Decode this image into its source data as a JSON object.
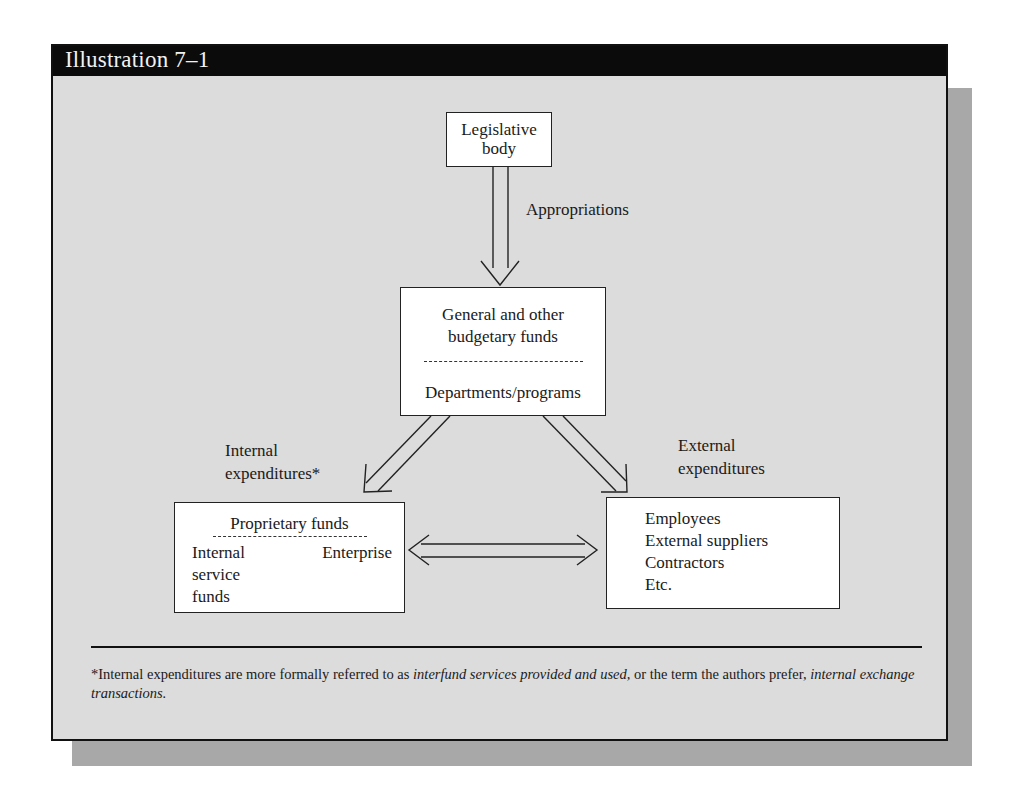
{
  "header": {
    "title": "Illustration 7–1"
  },
  "nodes": {
    "legislative": {
      "lines": [
        "Legislative",
        "body"
      ]
    },
    "general": {
      "lines": [
        "General and other",
        "budgetary funds"
      ],
      "sub": "Departments/programs"
    },
    "proprietary": {
      "title": "Proprietary funds",
      "left_lines": [
        "Internal",
        "service",
        "funds"
      ],
      "right": "Enterprise"
    },
    "external": {
      "lines": [
        "Employees",
        "External suppliers",
        "Contractors",
        "Etc."
      ]
    }
  },
  "edge_labels": {
    "appropriations": "Appropriations",
    "internal": [
      "Internal",
      "expenditures*"
    ],
    "external": [
      "External",
      "expenditures"
    ]
  },
  "edges": [
    {
      "from": "legislative",
      "to": "general",
      "label": "Appropriations",
      "direction": "down"
    },
    {
      "from": "general",
      "to": "proprietary",
      "label": "Internal expenditures*",
      "direction": "down-left"
    },
    {
      "from": "general",
      "to": "external",
      "label": "External expenditures",
      "direction": "down-right"
    },
    {
      "from": "proprietary",
      "to": "external",
      "label": "",
      "direction": "bidirectional"
    },
    {
      "from": "internal-service-funds",
      "to": "enterprise",
      "label": "",
      "direction": "bidirectional"
    }
  ],
  "footnote": {
    "p1": "*Internal expenditures are more formally referred to as ",
    "i1": "interfund services provided and used,",
    "p2": " or the term the authors prefer, ",
    "i2": "internal exchange transactions.",
    "p3": ""
  },
  "colors": {
    "header_bg": "#0b0b0b",
    "panel_bg": "#dcdcdc",
    "shadow": "#a8a8a8",
    "box_bg": "#ffffff"
  }
}
